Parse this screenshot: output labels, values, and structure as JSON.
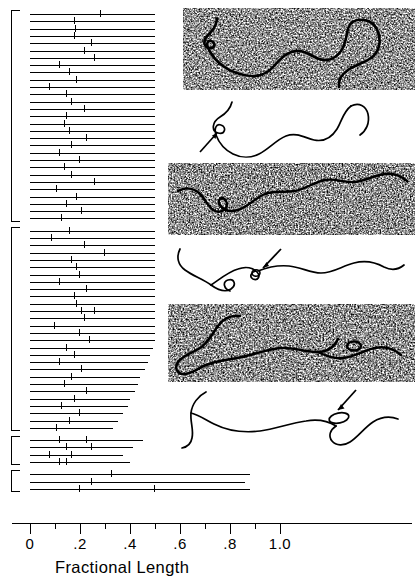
{
  "figure": {
    "kind": "histogram-with-electron-micrographs"
  },
  "axis": {
    "title": "Fractional Length",
    "major_labels": [
      "0",
      ".2",
      ".4",
      ".6",
      ".8",
      "1.0"
    ],
    "major_values": [
      0,
      0.2,
      0.4,
      0.6,
      0.8,
      1.0
    ],
    "minor_values": [
      0.1,
      0.3,
      0.5,
      0.7,
      0.9
    ],
    "range": [
      0,
      1.12
    ],
    "pixels_per_unit": 250,
    "origin_px": 30
  },
  "chart_data": {
    "type": "bar",
    "title": "",
    "xlabel": "Fractional Length",
    "ylabel": "",
    "xlim": [
      0,
      1.12
    ],
    "grid": false,
    "legend": null,
    "orientation": "horizontal",
    "note": "Each row is one DNA molecule drawn as a horizontal line whose length equals its measured fractional length; short vertical ticks mark positions of the observed loop/insertion features.",
    "groups": [
      {
        "group": 1,
        "bracket": true,
        "rows": [
          {
            "length": 0.5,
            "ticks": [
              0.28
            ]
          },
          {
            "length": 0.5,
            "ticks": [
              0.175
            ]
          },
          {
            "length": 0.5,
            "ticks": [
              0.18
            ]
          },
          {
            "length": 0.5,
            "ticks": [
              0.175
            ]
          },
          {
            "length": 0.5,
            "ticks": [
              0.245
            ]
          },
          {
            "length": 0.5,
            "ticks": [
              0.215
            ]
          },
          {
            "length": 0.5,
            "ticks": [
              0.255
            ]
          },
          {
            "length": 0.5,
            "ticks": [
              0.115
            ]
          },
          {
            "length": 0.5,
            "ticks": [
              0.155
            ]
          },
          {
            "length": 0.5,
            "ticks": [
              0.185
            ]
          },
          {
            "length": 0.5,
            "ticks": [
              0.075
            ]
          },
          {
            "length": 0.5,
            "ticks": [
              0.145
            ]
          },
          {
            "length": 0.5,
            "ticks": [
              0.165
            ]
          },
          {
            "length": 0.5,
            "ticks": [
              0.215
            ]
          },
          {
            "length": 0.5,
            "ticks": [
              0.145
            ]
          },
          {
            "length": 0.5,
            "ticks": [
              0.135
            ]
          },
          {
            "length": 0.5,
            "ticks": [
              0.155
            ]
          },
          {
            "length": 0.5,
            "ticks": [
              0.225
            ]
          },
          {
            "length": 0.5,
            "ticks": [
              0.165
            ]
          },
          {
            "length": 0.5,
            "ticks": [
              0.115
            ]
          },
          {
            "length": 0.5,
            "ticks": [
              0.195
            ]
          },
          {
            "length": 0.5,
            "ticks": [
              0.135
            ]
          },
          {
            "length": 0.5,
            "ticks": [
              0.165
            ]
          },
          {
            "length": 0.5,
            "ticks": [
              0.255
            ]
          },
          {
            "length": 0.5,
            "ticks": [
              0.105
            ]
          },
          {
            "length": 0.5,
            "ticks": [
              0.185
            ]
          },
          {
            "length": 0.5,
            "ticks": [
              0.145
            ]
          },
          {
            "length": 0.5,
            "ticks": [
              0.205
            ]
          },
          {
            "length": 0.5,
            "ticks": [
              0.125
            ]
          }
        ]
      },
      {
        "group": 2,
        "bracket": true,
        "rows": [
          {
            "length": 0.5,
            "ticks": [
              0.155
            ]
          },
          {
            "length": 0.5,
            "ticks": [
              0.085
            ]
          },
          {
            "length": 0.5,
            "ticks": [
              0.215
            ]
          },
          {
            "length": 0.5,
            "ticks": [
              0.295
            ]
          },
          {
            "length": 0.5,
            "ticks": [
              0.165
            ]
          },
          {
            "length": 0.5,
            "ticks": [
              0.185
            ]
          },
          {
            "length": 0.5,
            "ticks": [
              0.195
            ]
          },
          {
            "length": 0.5,
            "ticks": [
              0.115
            ]
          },
          {
            "length": 0.5,
            "ticks": [
              0.225
            ]
          },
          {
            "length": 0.5,
            "ticks": [
              0.175
            ]
          },
          {
            "length": 0.5,
            "ticks": [
              0.185
            ]
          },
          {
            "length": 0.5,
            "ticks": [
              0.205,
              0.255
            ]
          },
          {
            "length": 0.5,
            "ticks": [
              0.215
            ]
          },
          {
            "length": 0.5,
            "ticks": [
              0.095
            ]
          },
          {
            "length": 0.5,
            "ticks": [
              0.195
            ]
          },
          {
            "length": 0.5,
            "ticks": [
              0.235
            ]
          },
          {
            "length": 0.49,
            "ticks": [
              0.145
            ]
          },
          {
            "length": 0.48,
            "ticks": [
              0.175
            ]
          },
          {
            "length": 0.47,
            "ticks": [
              0.115
            ]
          },
          {
            "length": 0.46,
            "ticks": [
              0.205
            ]
          },
          {
            "length": 0.44,
            "ticks": [
              0.165
            ]
          },
          {
            "length": 0.43,
            "ticks": [
              0.135
            ]
          },
          {
            "length": 0.42,
            "ticks": [
              0.225
            ]
          },
          {
            "length": 0.4,
            "ticks": [
              0.175
            ]
          },
          {
            "length": 0.39,
            "ticks": [
              0.125
            ]
          },
          {
            "length": 0.37,
            "ticks": [
              0.195
            ]
          },
          {
            "length": 0.35,
            "ticks": [
              0.155
            ]
          },
          {
            "length": 0.33,
            "ticks": [
              0.105
            ]
          }
        ]
      },
      {
        "group": 3,
        "bracket": true,
        "rows": [
          {
            "length": 0.45,
            "ticks": [
              0.115,
              0.225
            ]
          },
          {
            "length": 0.41,
            "ticks": [
              0.145,
              0.245
            ]
          },
          {
            "length": 0.37,
            "ticks": [
              0.075,
              0.165
            ]
          },
          {
            "length": 0.4,
            "ticks": [
              0.115,
              0.145
            ]
          }
        ]
      },
      {
        "group": 4,
        "bracket": true,
        "rows": [
          {
            "length": 0.88,
            "ticks": [
              0.325
            ]
          },
          {
            "length": 0.86,
            "ticks": [
              0.245
            ]
          },
          {
            "length": 0.88,
            "ticks": [
              0.195,
              0.495
            ]
          }
        ]
      }
    ]
  },
  "panels": [
    {
      "name": "micrograph-1",
      "type": "electron-micrograph",
      "annotations": []
    },
    {
      "name": "tracing-1",
      "type": "line-tracing",
      "annotations": [
        "arrow",
        "loop"
      ]
    },
    {
      "name": "micrograph-2",
      "type": "electron-micrograph",
      "annotations": []
    },
    {
      "name": "tracing-2",
      "type": "line-tracing",
      "annotations": [
        "arrow",
        "loop"
      ]
    },
    {
      "name": "micrograph-3",
      "type": "electron-micrograph",
      "annotations": []
    },
    {
      "name": "tracing-3",
      "type": "line-tracing",
      "annotations": [
        "arrow",
        "loop"
      ]
    }
  ],
  "colors": {
    "ink": "#000000",
    "background": "#ffffff"
  }
}
